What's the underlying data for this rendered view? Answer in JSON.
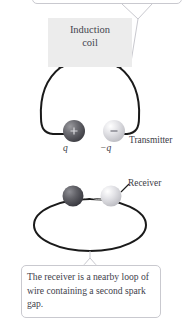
{
  "figure": {
    "background_color": "#ffffff",
    "text_color": "#3c3c46"
  },
  "top_callout": {
    "text": "",
    "border_color": "#c9c9cf",
    "fill_color": "#ffffff",
    "clipped": "true"
  },
  "coil": {
    "label_line1": "Induction",
    "label_line2": "coil",
    "fill_color": "#ececec",
    "terminal_color": "#1c1c1c"
  },
  "labels": {
    "transmitter": "Transmitter",
    "receiver": "Receiver",
    "charge_positive": "q",
    "charge_negative": "−q"
  },
  "spheres": {
    "positive_sign": "+",
    "negative_sign": "−",
    "dark_color": "#5a5a5e",
    "light_color": "#d8d8dc"
  },
  "wire": {
    "color": "#1a1a1a"
  },
  "bottom_callout": {
    "text": "The receiver is a nearby loop of wire containing a second spark gap.",
    "border_color": "#c9c9cf",
    "fill_color": "#ffffff"
  }
}
